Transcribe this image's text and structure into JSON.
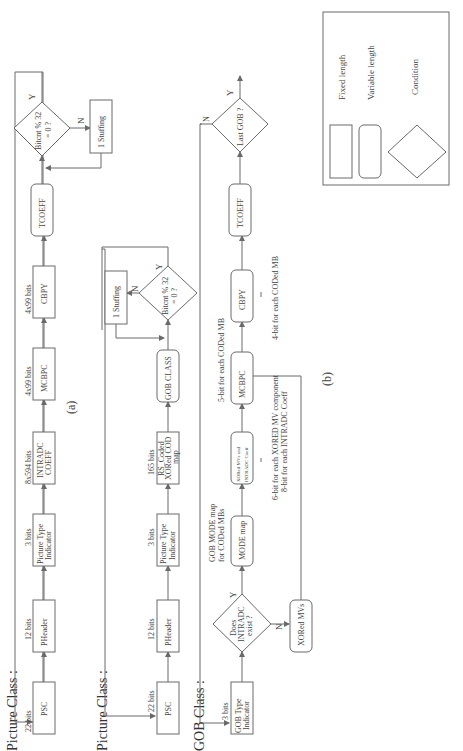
{
  "diagram": {
    "orientation": "rotated 90 degrees counter-clockwise",
    "part_a": {
      "caption": "(a)",
      "class_label": "Picture Class :",
      "blocks": [
        {
          "id": "psc_a",
          "label": "PSC",
          "bits": "22 bits",
          "shape": "fixed"
        },
        {
          "id": "pheader_a",
          "label": "PHeader",
          "bits": "12 bits",
          "shape": "fixed"
        },
        {
          "id": "pti_a",
          "label1": "Picture Type",
          "label2": "Indicator",
          "bits": "3 bits",
          "shape": "fixed"
        },
        {
          "id": "intradc_a",
          "label1": "INTRADC",
          "label2": "COEFF",
          "bits": "8x594 bits",
          "shape": "fixed"
        },
        {
          "id": "mcbpc_a",
          "label": "MCBPC",
          "bits": "4x99 bits",
          "shape": "fixed"
        },
        {
          "id": "cbpy_a",
          "label": "CBPY",
          "bits": "4x99 bits",
          "shape": "fixed"
        },
        {
          "id": "tcoeff_a",
          "label": "TCOEFF",
          "shape": "variable"
        },
        {
          "id": "bitcnt_a",
          "label1": "Bitcnt % 32",
          "label2": "= 0 ?",
          "shape": "condition",
          "yes": "Y",
          "no": "N"
        },
        {
          "id": "stuff_a",
          "label": "1  Stuffing",
          "shape": "fixed"
        }
      ]
    },
    "part_b": {
      "caption": "(b)",
      "picture_class_label": "Picture Class :",
      "gob_class_label": "GOB Class :",
      "picture_blocks": [
        {
          "id": "psc_b",
          "label": "PSC",
          "bits": "22 bits",
          "shape": "fixed"
        },
        {
          "id": "pheader_b",
          "label": "PHeader",
          "bits": "12 bits",
          "shape": "fixed"
        },
        {
          "id": "pti_b",
          "label1": "Picture Type",
          "label2": "Indicator",
          "bits": "3 bits",
          "shape": "fixed"
        },
        {
          "id": "rs_b",
          "label1": "RS_Coded",
          "label2": "XORed COD",
          "label3": "map",
          "bits": "165 bits",
          "shape": "fixed"
        },
        {
          "id": "gobclass_b",
          "label": "GOB CLASS",
          "shape": "variable"
        },
        {
          "id": "bitcnt_b",
          "label1": "Bitcnt % 32",
          "label2": "= 0 ?",
          "shape": "condition",
          "yes": "Y",
          "no": "N"
        },
        {
          "id": "stuff_b",
          "label": "1  Stuffing",
          "shape": "fixed"
        }
      ],
      "gob_blocks": [
        {
          "id": "gobtype",
          "label1": "GOB Type",
          "label2": "Indicator",
          "bits": "3 bits",
          "shape": "fixed"
        },
        {
          "id": "intradc_q",
          "label1": "Does",
          "label2": "INTRADC",
          "label3": "exist ?",
          "shape": "condition",
          "yes": "Y",
          "no": "N"
        },
        {
          "id": "xoredmvs",
          "label": "XORed MVs",
          "shape": "variable"
        },
        {
          "id": "modemap",
          "label": "MODE map",
          "shape": "variable",
          "note1": "GOB MODE map",
          "note2": "for CODed MBs"
        },
        {
          "id": "xoredmv_intra",
          "label1": "XORed MVs and",
          "label2": "INTRADC Coeff",
          "shape": "variable",
          "note1": "6-bit for each XORED MV component",
          "note2": "8-bit for each INTRADC Coeff"
        },
        {
          "id": "mcbpc_b",
          "label": "MCBPC",
          "shape": "variable",
          "note": "5-bit for each CODed MB"
        },
        {
          "id": "cbpy_b",
          "label": "CBPY",
          "shape": "variable",
          "note": "4-bit for each CODed MB"
        },
        {
          "id": "tcoeff_b",
          "label": "TCOEFF",
          "shape": "variable"
        },
        {
          "id": "lastgob",
          "label": "Last GOB ?",
          "shape": "condition",
          "yes": "Y",
          "no": "N"
        }
      ]
    },
    "legend": {
      "items": [
        {
          "shape": "fixed",
          "label": "Fixed length"
        },
        {
          "shape": "variable",
          "label": "Variable length"
        },
        {
          "shape": "condition",
          "label": "Condition"
        }
      ]
    }
  }
}
